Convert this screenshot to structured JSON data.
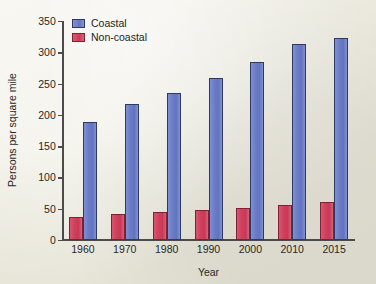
{
  "chart_data": {
    "type": "bar",
    "title": "",
    "xlabel": "Year",
    "ylabel": "Persons per square mile",
    "categories": [
      "1960",
      "1970",
      "1980",
      "1990",
      "2000",
      "2010",
      "2015"
    ],
    "series": [
      {
        "name": "Non-coastal",
        "color": "#ca3b58",
        "values": [
          37,
          41,
          45,
          48,
          51,
          56,
          61
        ]
      },
      {
        "name": "Coastal",
        "color": "#6375c1",
        "values": [
          189,
          218,
          235,
          259,
          284,
          314,
          323
        ]
      }
    ],
    "ylim": [
      0,
      350
    ],
    "yticks": [
      0,
      50,
      100,
      150,
      200,
      250,
      300,
      350
    ],
    "ytick_labels": [
      "0",
      "50",
      "100",
      "150",
      "200",
      "250",
      "300",
      "350"
    ],
    "grid": false,
    "legend_position": "top-left",
    "legend_entries": [
      "Coastal",
      "Non-coastal"
    ],
    "background_color": "#eae8dc",
    "axis_color": "#4b4b4b"
  }
}
